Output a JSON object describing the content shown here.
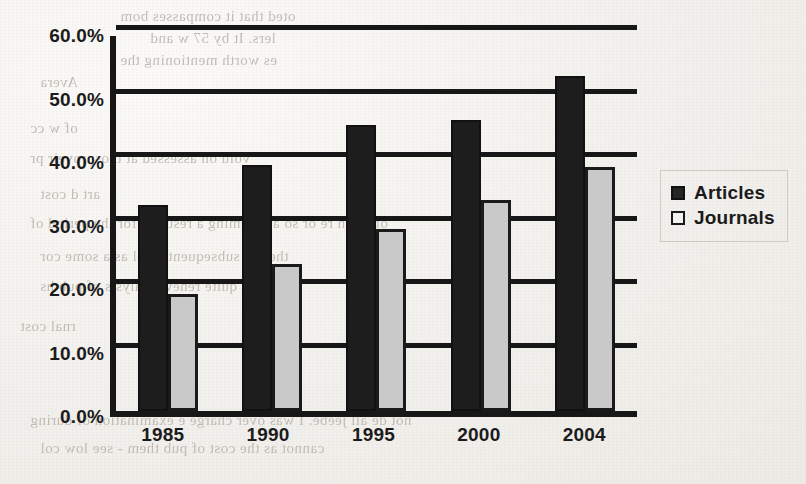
{
  "chart_data": {
    "type": "bar",
    "title": "",
    "xlabel": "",
    "ylabel": "",
    "categories": [
      "1985",
      "1990",
      "1995",
      "2000",
      "2004"
    ],
    "series": [
      {
        "name": "Articles",
        "color": "#1d1d1d",
        "values": [
          32.5,
          38.8,
          45.0,
          45.8,
          52.8
        ]
      },
      {
        "name": "Journals",
        "color": "#c9c9c9",
        "values": [
          18.5,
          23.2,
          28.7,
          33.3,
          38.5
        ]
      }
    ],
    "ylim": [
      0,
      60
    ],
    "yticks": [
      "0.0%",
      "10.0%",
      "20.0%",
      "30.0%",
      "40.0%",
      "50.0%",
      "60.0%"
    ],
    "ytick_values": [
      0,
      10,
      20,
      30,
      40,
      50,
      60
    ],
    "grid": true,
    "legend_position": "right"
  },
  "legend": {
    "entries": [
      {
        "label": "Articles",
        "marker": "filled-dark-square"
      },
      {
        "label": "Journals",
        "marker": "outlined-light-square"
      }
    ]
  },
  "background_bleed": [
    {
      "text": "oted that it compasses bom",
      "x": 120,
      "y": 8
    },
    {
      "text": "lers. It by 57 w and",
      "x": 150,
      "y": 30
    },
    {
      "text": "es worth mentioning the",
      "x": 120,
      "y": 52
    },
    {
      "text": "Avera",
      "x": 40,
      "y": 74
    },
    {
      "text": "of w cc",
      "x": 30,
      "y": 120
    },
    {
      "text": "volu on assessed at thosproveir pr",
      "x": 30,
      "y": 150
    },
    {
      "text": "art d cost",
      "x": 40,
      "y": 186
    },
    {
      "text": "of 24 th re or so amtoeming a resulted for the period of",
      "x": 30,
      "y": 215
    },
    {
      "text": "then to subsequent level as a some cor",
      "x": 40,
      "y": 248
    },
    {
      "text": "A quite renew analysis of pub hs",
      "x": 40,
      "y": 278
    },
    {
      "text": "rnal cost",
      "x": 20,
      "y": 318
    },
    {
      "text": "not de all jeebe. I was over charge e examination of during",
      "x": 30,
      "y": 412
    },
    {
      "text": "cannot as the cost of pub them - see low col",
      "x": 40,
      "y": 440
    }
  ]
}
